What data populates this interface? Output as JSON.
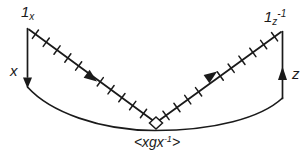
{
  "figure": {
    "background": "#ffffff",
    "ink": "#1a1a1a"
  },
  "labels": {
    "top_left_identity": {
      "main": "1",
      "sub": "x",
      "sup": ""
    },
    "top_right_identity": {
      "main": "1",
      "sub": "z",
      "sup": "-1"
    },
    "left_wire": "x",
    "right_wire": "z",
    "bottom_conjugacy": {
      "pre": "<xgx",
      "sup": "-1",
      "post": ">"
    }
  }
}
